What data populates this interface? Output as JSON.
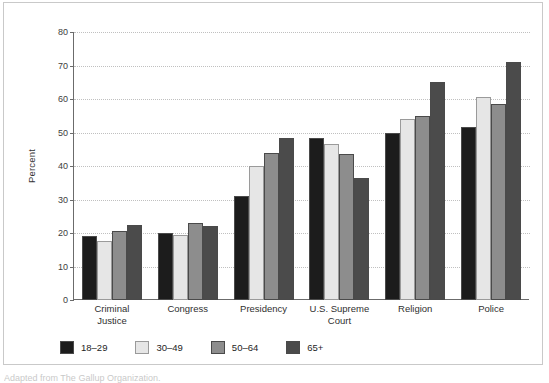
{
  "chart_data": {
    "type": "bar",
    "title": "",
    "subtitle": "",
    "xlabel": "",
    "ylabel": "Percent",
    "ylim": [
      0,
      80
    ],
    "yticks": [
      0,
      10,
      20,
      30,
      40,
      50,
      60,
      70,
      80
    ],
    "grid": true,
    "legend_position": "bottom",
    "categories": [
      "Criminal Justice",
      "Congress",
      "Presidency",
      "U.S. Supreme Court",
      "Religion",
      "Police"
    ],
    "category_lines": [
      [
        "Criminal",
        "Justice"
      ],
      [
        "Congress"
      ],
      [
        "Presidency"
      ],
      [
        "U.S. Supreme",
        "Court"
      ],
      [
        "Religion"
      ],
      [
        "Police"
      ]
    ],
    "series": [
      {
        "name": "18–29",
        "color": "#1c1c1c",
        "values": [
          19,
          20,
          31,
          48.5,
          50,
          51.5
        ]
      },
      {
        "name": "30–49",
        "color": "#e6e6e6",
        "values": [
          17.5,
          19.5,
          40,
          46.5,
          54,
          60.5
        ]
      },
      {
        "name": "50–64",
        "color": "#8d8d8d",
        "values": [
          20.5,
          23,
          44,
          43.5,
          55,
          58.5
        ]
      },
      {
        "name": "65+",
        "color": "#4b4b4b",
        "values": [
          22.5,
          22,
          48.5,
          36.5,
          65,
          71
        ]
      }
    ]
  },
  "caption": {
    "text": "Adapted from The Gallup Organization."
  },
  "colors": {
    "axis": "#6b6b6b",
    "grid": "#c0c0c0",
    "frame": "#c9c9c9",
    "text": "#2f2f2f"
  }
}
